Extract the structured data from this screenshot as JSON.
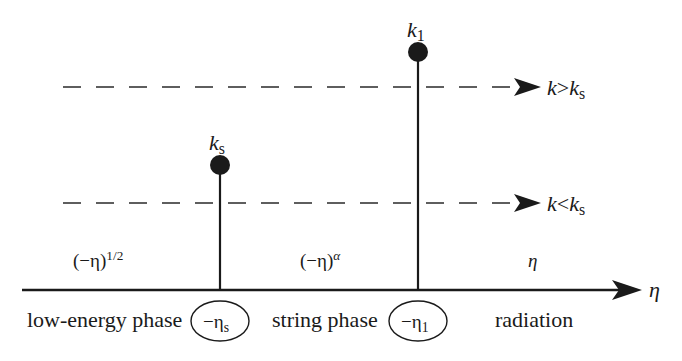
{
  "diagram": {
    "axis": {
      "label": "η"
    },
    "modes": [
      {
        "id": "k_greater",
        "label_k": "k",
        "relation": ">",
        "label_ref": "k",
        "label_ref_sub": "s"
      },
      {
        "id": "k_less",
        "label_k": "k",
        "relation": "<",
        "label_ref": "k",
        "label_ref_sub": "s"
      }
    ],
    "markers": [
      {
        "id": "ks",
        "label": "k",
        "label_sub": "s",
        "time_label": "−η",
        "time_sub": "s"
      },
      {
        "id": "k1",
        "label": "k",
        "label_sub": "1",
        "time_label": "−η",
        "time_sub": "1"
      }
    ],
    "phases": [
      {
        "id": "low-energy",
        "name": "low-energy phase",
        "scaling_base": "(−η)",
        "scaling_exp": "1/2"
      },
      {
        "id": "string",
        "name": "string phase",
        "scaling_base": "(−η)",
        "scaling_exp": "α"
      },
      {
        "id": "radiation",
        "name": "radiation",
        "scaling_base": "η",
        "scaling_exp": ""
      }
    ],
    "colors": {
      "ink": "#1a1a1a",
      "background": "#ffffff"
    }
  }
}
